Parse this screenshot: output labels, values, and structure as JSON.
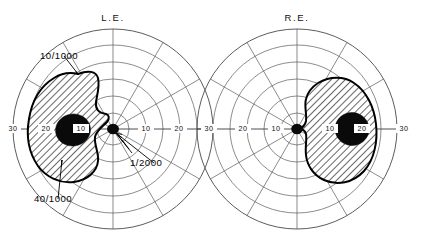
{
  "figure": {
    "type": "visual-field-perimetry-chart",
    "background_color": "#ffffff",
    "ink_color": "#111111"
  },
  "charts": [
    {
      "id": "left-eye",
      "title": "L.E.",
      "center": {
        "x": 113,
        "y": 129
      },
      "tick_labels": [
        {
          "text": "30",
          "x": 13,
          "y": 131,
          "anchor": "middle"
        },
        {
          "text": "20",
          "x": 46,
          "y": 131,
          "anchor": "middle"
        },
        {
          "text": "10",
          "x": 81,
          "y": 131,
          "anchor": "middle"
        },
        {
          "text": "10",
          "x": 146,
          "y": 131,
          "anchor": "middle"
        },
        {
          "text": "20",
          "x": 179,
          "y": 131,
          "anchor": "middle"
        },
        {
          "text": "30",
          "x": 211,
          "y": 131,
          "anchor": "middle"
        }
      ],
      "rings": [
        16,
        33,
        50,
        67,
        84,
        100
      ],
      "ring_degrees": [
        5,
        10,
        15,
        20,
        25,
        30
      ],
      "meridian_count": 12,
      "meridian_step_degrees": 30,
      "annotations": [
        {
          "label": "10/1000",
          "x": 40,
          "y": 53,
          "leader_to_x": 78,
          "leader_to_y": 74
        },
        {
          "label": "40/1000",
          "x": 34,
          "y": 196,
          "leader_to_x": 62,
          "leader_to_y": 160
        },
        {
          "label": "1/2000",
          "x": 130,
          "y": 160,
          "leader_to_x": 116,
          "leader_to_y": 133
        }
      ],
      "fixation_point": {
        "x": 113,
        "y": 129,
        "rx": 6.0,
        "ry": 5.2
      },
      "relative_scotoma_path": "M 78,74 C 88,70 96,71 98,78 C 100,86 97,95 96,102 C 95,110 99,113 106,114 C 109,115 110,118 107,122 C 102,127 96,131 95,137 C 94,145 99,152 98,161 C 97,172 87,180 74,182 C 60,184 46,177 38,166 C 29,153 26,136 29,119 C 32,100 41,86 54,78 C 62,73 70,72 78,74 Z",
      "absolute_scotoma": {
        "cx": 73,
        "cy": 130,
        "rx": 17.5,
        "ry": 16.0,
        "rotation": -8
      }
    },
    {
      "id": "right-eye",
      "title": "R.E.",
      "center": {
        "x": 297,
        "y": 129
      },
      "tick_labels": [
        {
          "text": "30",
          "x": 209,
          "y": 131,
          "anchor": "middle"
        },
        {
          "text": "20",
          "x": 243,
          "y": 131,
          "anchor": "middle"
        },
        {
          "text": "10",
          "x": 276,
          "y": 131,
          "anchor": "middle"
        },
        {
          "text": "10",
          "x": 330,
          "y": 131,
          "anchor": "middle"
        },
        {
          "text": "20",
          "x": 362,
          "y": 131,
          "anchor": "middle"
        },
        {
          "text": "30",
          "x": 404,
          "y": 131,
          "anchor": "middle"
        }
      ],
      "rings": [
        16,
        33,
        50,
        67,
        84,
        100
      ],
      "ring_degrees": [
        5,
        10,
        15,
        20,
        25,
        30
      ],
      "meridian_count": 12,
      "meridian_step_degrees": 30,
      "annotations": [],
      "fixation_point": {
        "x": 297,
        "y": 129,
        "rx": 5.8,
        "ry": 5.2
      },
      "relative_scotoma_path": "M 318,83 C 330,76 344,76 354,83 C 366,91 374,106 376,124 C 378,142 374,160 364,171 C 353,183 337,186 324,180 C 313,175 307,165 306,155 C 305,147 307,140 306,134 C 305,130 302,129 299,129 C 302,128 305,126 306,121 C 307,114 304,106 306,99 C 308,91 312,87 318,83 Z",
      "absolute_scotoma": {
        "cx": 352,
        "cy": 129,
        "rx": 17.0,
        "ry": 16.5,
        "rotation": 5
      }
    }
  ],
  "legend": {
    "isopter_notation": [
      "10/1000",
      "40/1000",
      "1/2000"
    ],
    "scotoma_fill": "hatched",
    "absolute_scotoma_fill": "#0a0a0a"
  }
}
